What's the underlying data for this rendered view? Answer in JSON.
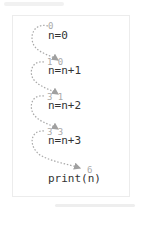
{
  "diagram": {
    "statements": [
      {
        "code": "n=0",
        "annotation": "0"
      },
      {
        "code": "n=n+1",
        "annotation": "1 0"
      },
      {
        "code": "n=n+2",
        "annotation": "3 1"
      },
      {
        "code": "n=n+3",
        "annotation": "3 3"
      },
      {
        "code": "print(n)",
        "annotation": "6"
      }
    ],
    "colors": {
      "text": "#333333",
      "annotation": "#aaaaaa",
      "arrow": "#a0a0a0",
      "border": "#ececec"
    }
  }
}
